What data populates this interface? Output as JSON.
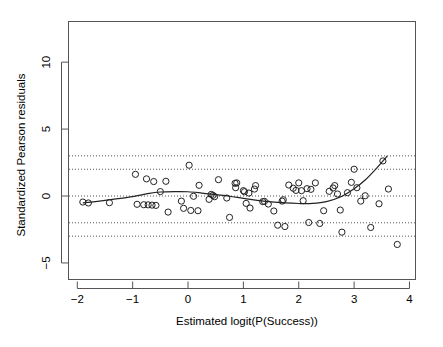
{
  "chart_data": {
    "type": "scatter",
    "title": "",
    "subtitle": "",
    "xlabel": "Estimated logit(P(Success))",
    "ylabel": "Standardized Pearson residuals",
    "xlim": [
      -2.15,
      4.1
    ],
    "ylim": [
      -6.2,
      13.0
    ],
    "xticks": [
      -2,
      -1,
      0,
      1,
      2,
      3,
      4
    ],
    "xticklabels": [
      "−2",
      "−1",
      "0",
      "1",
      "2",
      "3",
      "4"
    ],
    "yticks": [
      -5,
      0,
      5,
      10
    ],
    "yticklabels": [
      "−5",
      "0",
      "5",
      "10"
    ],
    "grid": false,
    "legend": null,
    "point_marker": "open-circle",
    "point_color": "#222222",
    "curve_color": "#222222",
    "reference_line_color": "#555555",
    "reference_lines": [
      {
        "y": 3,
        "style": "dotted"
      },
      {
        "y": 2,
        "style": "dotted"
      },
      {
        "y": 0,
        "style": "dotted"
      },
      {
        "y": -2,
        "style": "dotted"
      },
      {
        "y": -3,
        "style": "dotted"
      }
    ],
    "points": [
      {
        "x": -1.9,
        "y": -0.45
      },
      {
        "x": -1.8,
        "y": -0.52
      },
      {
        "x": -1.42,
        "y": -0.5
      },
      {
        "x": -0.95,
        "y": 1.62
      },
      {
        "x": -0.92,
        "y": -0.62
      },
      {
        "x": -0.8,
        "y": -0.65
      },
      {
        "x": -0.75,
        "y": 1.28
      },
      {
        "x": -0.72,
        "y": -0.66
      },
      {
        "x": -0.65,
        "y": -0.68
      },
      {
        "x": -0.62,
        "y": 1.08
      },
      {
        "x": -0.58,
        "y": -0.7
      },
      {
        "x": -0.5,
        "y": 0.33
      },
      {
        "x": -0.4,
        "y": 1.1
      },
      {
        "x": -0.36,
        "y": -1.2
      },
      {
        "x": -0.12,
        "y": -0.38
      },
      {
        "x": -0.08,
        "y": -0.92
      },
      {
        "x": 0.02,
        "y": 2.3
      },
      {
        "x": 0.05,
        "y": -1.08
      },
      {
        "x": 0.1,
        "y": -0.02
      },
      {
        "x": 0.18,
        "y": -1.1
      },
      {
        "x": 0.2,
        "y": 0.8
      },
      {
        "x": 0.38,
        "y": -0.25
      },
      {
        "x": 0.42,
        "y": 0.12
      },
      {
        "x": 0.45,
        "y": 0.05
      },
      {
        "x": 0.48,
        "y": -0.05
      },
      {
        "x": 0.55,
        "y": 1.22
      },
      {
        "x": 0.7,
        "y": -0.15
      },
      {
        "x": 0.75,
        "y": -1.6
      },
      {
        "x": 0.85,
        "y": 0.95
      },
      {
        "x": 0.86,
        "y": 0.62
      },
      {
        "x": 0.88,
        "y": 0.98
      },
      {
        "x": 1.0,
        "y": 0.4
      },
      {
        "x": 1.02,
        "y": 0.32
      },
      {
        "x": 1.05,
        "y": -0.55
      },
      {
        "x": 1.1,
        "y": 0.22
      },
      {
        "x": 1.12,
        "y": -0.9
      },
      {
        "x": 1.2,
        "y": 0.52
      },
      {
        "x": 1.22,
        "y": 0.78
      },
      {
        "x": 1.35,
        "y": -0.42
      },
      {
        "x": 1.38,
        "y": -0.4
      },
      {
        "x": 1.45,
        "y": -0.6
      },
      {
        "x": 1.55,
        "y": -1.12
      },
      {
        "x": 1.62,
        "y": -2.18
      },
      {
        "x": 1.7,
        "y": -0.38
      },
      {
        "x": 1.72,
        "y": -0.28
      },
      {
        "x": 1.75,
        "y": -2.28
      },
      {
        "x": 1.82,
        "y": 0.82
      },
      {
        "x": 1.9,
        "y": 0.58
      },
      {
        "x": 1.95,
        "y": 0.42
      },
      {
        "x": 2.0,
        "y": 0.98
      },
      {
        "x": 2.05,
        "y": 0.4
      },
      {
        "x": 2.08,
        "y": -0.35
      },
      {
        "x": 2.15,
        "y": 0.55
      },
      {
        "x": 2.18,
        "y": -1.98
      },
      {
        "x": 2.22,
        "y": 0.5
      },
      {
        "x": 2.3,
        "y": 0.98
      },
      {
        "x": 2.38,
        "y": -2.05
      },
      {
        "x": 2.45,
        "y": -1.1
      },
      {
        "x": 2.55,
        "y": 0.35
      },
      {
        "x": 2.62,
        "y": 0.6
      },
      {
        "x": 2.65,
        "y": 0.78
      },
      {
        "x": 2.7,
        "y": 0.15
      },
      {
        "x": 2.75,
        "y": -1.05
      },
      {
        "x": 2.78,
        "y": -2.7
      },
      {
        "x": 2.88,
        "y": 0.25
      },
      {
        "x": 2.95,
        "y": 1.02
      },
      {
        "x": 3.0,
        "y": 2.0
      },
      {
        "x": 3.05,
        "y": 0.62
      },
      {
        "x": 3.12,
        "y": -0.38
      },
      {
        "x": 3.2,
        "y": 0.02
      },
      {
        "x": 3.3,
        "y": -2.35
      },
      {
        "x": 3.45,
        "y": -0.58
      },
      {
        "x": 3.52,
        "y": 2.62
      },
      {
        "x": 3.62,
        "y": 0.52
      },
      {
        "x": 3.78,
        "y": -3.62
      }
    ],
    "smooth_curve": {
      "name": "loess-fit",
      "x": [
        -1.9,
        -1.6,
        -1.3,
        -1.0,
        -0.7,
        -0.5,
        -0.25,
        0.0,
        0.25,
        0.5,
        0.75,
        1.0,
        1.25,
        1.5,
        1.75,
        2.0,
        2.25,
        2.5,
        2.75,
        3.0,
        3.2,
        3.4,
        3.6
      ],
      "y": [
        -0.52,
        -0.38,
        -0.22,
        -0.05,
        0.2,
        0.3,
        0.33,
        0.32,
        0.22,
        0.1,
        -0.02,
        -0.18,
        -0.32,
        -0.44,
        -0.52,
        -0.56,
        -0.55,
        -0.42,
        -0.08,
        0.55,
        1.2,
        2.05,
        3.0
      ]
    }
  }
}
